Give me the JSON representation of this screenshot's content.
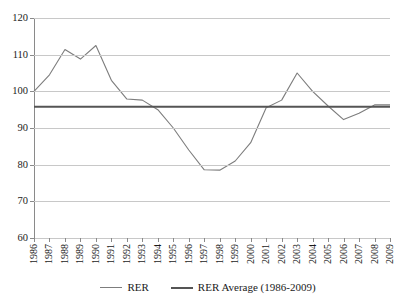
{
  "chart_data": {
    "type": "line",
    "title": "",
    "xlabel": "",
    "ylabel": "",
    "ylim": [
      60,
      120
    ],
    "y_ticks": [
      60,
      70,
      80,
      90,
      100,
      110,
      120
    ],
    "grid": true,
    "legend_position": "bottom",
    "categories": [
      "1986",
      "1987",
      "1988",
      "1989",
      "1990",
      "1991",
      "1992",
      "1993",
      "1994",
      "1995",
      "1996",
      "1997",
      "1998",
      "1999",
      "2000",
      "2001",
      "2002",
      "2003",
      "2004",
      "2005",
      "2006",
      "2007",
      "2008",
      "2009"
    ],
    "series": [
      {
        "name": "RER",
        "color": "#7d7d7d",
        "values": [
          100.0,
          104.5,
          111.4,
          108.8,
          112.5,
          103.0,
          97.9,
          97.6,
          95.0,
          90.0,
          84.0,
          78.6,
          78.5,
          81.0,
          86.0,
          95.5,
          97.6,
          105.0,
          100.0,
          96.0,
          92.3,
          94.0,
          96.3,
          96.3
        ]
      },
      {
        "name": "RER Average (1986-2009)",
        "color": "#555555",
        "values": [
          95.8,
          95.8,
          95.8,
          95.8,
          95.8,
          95.8,
          95.8,
          95.8,
          95.8,
          95.8,
          95.8,
          95.8,
          95.8,
          95.8,
          95.8,
          95.8,
          95.8,
          95.8,
          95.8,
          95.8,
          95.8,
          95.8,
          95.8,
          95.8
        ]
      }
    ],
    "legend": [
      {
        "label": "RER",
        "style": "rer"
      },
      {
        "label": "RER Average (1986-2009)",
        "style": "avg"
      }
    ]
  }
}
